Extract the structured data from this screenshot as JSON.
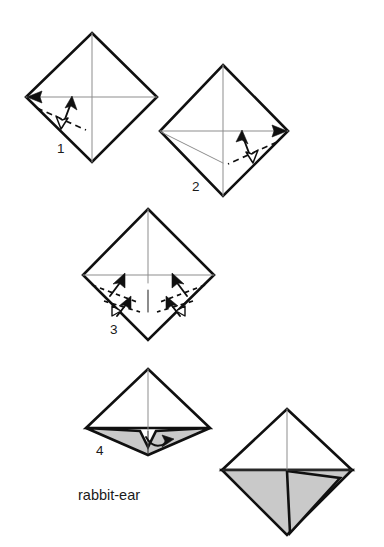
{
  "document": {
    "type": "origami-instruction-diagram",
    "caption": "rabbit-ear",
    "background_color": "#ffffff",
    "ink_color": "#101010",
    "crease_color": "#8d8d8d",
    "shaded_paper_color": "#c9c9c9"
  },
  "steps": [
    {
      "number": "1",
      "label_x": 57,
      "label_y": 153,
      "shape": "square-diamond",
      "description": "Square sheet, point-up diamond, with vertical and horizontal center creases. Valley-fold the lower-left edge to the horizontal crease.",
      "creases": [
        "vertical-center",
        "horizontal-center"
      ],
      "fold_marks": [
        "valley-dashed-lower-left",
        "arrow-up-right",
        "arrow-into-left-vertex"
      ]
    },
    {
      "number": "2",
      "label_x": 192,
      "label_y": 191,
      "shape": "square-diamond",
      "description": "Same diamond with the new crease from step 1 shown from the left vertex. Valley-fold the lower-right edge to the horizontal crease.",
      "creases": [
        "vertical-center",
        "horizontal-center",
        "left-vertex-diagonal"
      ],
      "fold_marks": [
        "valley-dashed-lower-right",
        "arrow-up-left",
        "arrow-into-right-vertex"
      ]
    },
    {
      "number": "3",
      "label_x": 110,
      "label_y": 334,
      "shape": "square-diamond",
      "description": "Both lower edges raised together toward the vertical crease; bottom point pushed up to collapse the rabbit ear.",
      "creases": [
        "vertical-center",
        "horizontal-center",
        "vertical-short-bottom"
      ],
      "fold_marks": [
        "valley-dashed-left",
        "valley-dashed-right",
        "arrows-up-left-pair",
        "arrows-up-right-pair",
        "push-markers-bottom"
      ]
    },
    {
      "number": "4",
      "label_x": 96,
      "label_y": 455,
      "shape": "collapsed-kite",
      "description": "Collapsed rabbit-ear form with shaded underside. Swing the central flap to the right.",
      "shaded": true,
      "fold_marks": [
        "curved-arrow-right"
      ]
    },
    {
      "number": "",
      "label_x": 0,
      "label_y": 0,
      "shape": "finished-kite",
      "description": "Finished rabbit ear: flap laid to the right, shaded underside visible.",
      "shaded": true,
      "fold_marks": []
    }
  ],
  "caption_position": {
    "x": 78,
    "y": 500
  },
  "icons": {
    "valley_fold": "dashed-line",
    "fold_arrow": "solid-arrowhead",
    "push_marker": "hollow-triangle",
    "swing_arrow": "curved-arrow"
  }
}
